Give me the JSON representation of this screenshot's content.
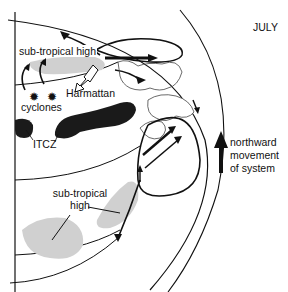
{
  "diagram": {
    "month_label": "JULY",
    "labels": {
      "subtropical_high_north": "sub-tropical high",
      "harmattan": "Harmattan",
      "cyclones": "cyclones",
      "itcz": "ITCZ",
      "subtropical_high_south_line1": "sub-tropical",
      "subtropical_high_south_line2": "high"
    },
    "legend": {
      "arrow_icon": "arrow-up-icon",
      "line1": "northward",
      "line2": "movement",
      "line3": "of system"
    },
    "colors": {
      "line": "#111111",
      "itcz_fill": "#1a1a1a",
      "high_pressure_fill": "#d0d0d0",
      "background": "#ffffff"
    }
  }
}
